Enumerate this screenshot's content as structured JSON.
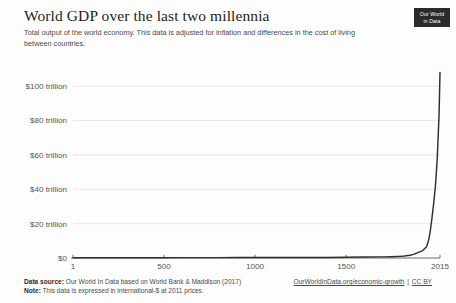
{
  "header": {
    "title": "World GDP over the last two millennia",
    "subtitle": "Total output of the world economy. This data is adjusted for inflation and differences in the cost of living between countries.",
    "logo_line1": "Our World",
    "logo_line2": "in Data"
  },
  "footer": {
    "source_label": "Data source:",
    "source_text": "Our World In Data based on World Bank & Maddison (2017)",
    "note_label": "Note:",
    "note_text": "This data is expressed in international-$ at 2011 prices.",
    "link_text": "OurWorldInData.org/economic-growth",
    "separator": "|",
    "license_text": "CC BY"
  },
  "colors": {
    "line": "#2f2f2f",
    "grid": "#e2e2e2",
    "axis": "#5b5b5b",
    "logo_bg": "#2b2b2b",
    "text": "#4a4a4a"
  },
  "chart_data": {
    "type": "line",
    "title": "World GDP over the last two millennia",
    "subtitle": "Total output of the world economy. This data is adjusted for inflation and differences in the cost of living between countries.",
    "xlabel": "",
    "ylabel": "",
    "units": "trillion international-$ (2011 prices)",
    "xlim": [
      1,
      2015
    ],
    "ylim": [
      0,
      110
    ],
    "grid": true,
    "legend": false,
    "x_ticks": [
      1,
      500,
      1000,
      1500,
      2015
    ],
    "x_tick_labels": [
      "1",
      "500",
      "1000",
      "1500",
      "2015"
    ],
    "y_ticks": [
      0,
      20,
      40,
      60,
      80,
      100
    ],
    "y_tick_labels": [
      "$0",
      "$20 trillion",
      "$40 trillion",
      "$60 trillion",
      "$80 trillion",
      "$100 trillion"
    ],
    "series": [
      {
        "name": "World GDP",
        "x": [
          1,
          200,
          400,
          500,
          600,
          700,
          800,
          900,
          1000,
          1100,
          1200,
          1300,
          1400,
          1500,
          1600,
          1700,
          1750,
          1800,
          1820,
          1850,
          1870,
          1900,
          1920,
          1940,
          1950,
          1960,
          1970,
          1980,
          1990,
          2000,
          2010,
          2015
        ],
        "values": [
          0.18,
          0.19,
          0.19,
          0.2,
          0.21,
          0.22,
          0.23,
          0.24,
          0.25,
          0.28,
          0.31,
          0.34,
          0.33,
          0.43,
          0.53,
          0.64,
          0.77,
          0.99,
          1.2,
          1.6,
          2.1,
          3.4,
          4.3,
          6.4,
          9.3,
          14.5,
          22.5,
          31.5,
          42.0,
          58.0,
          84.0,
          108.0
        ]
      }
    ]
  }
}
